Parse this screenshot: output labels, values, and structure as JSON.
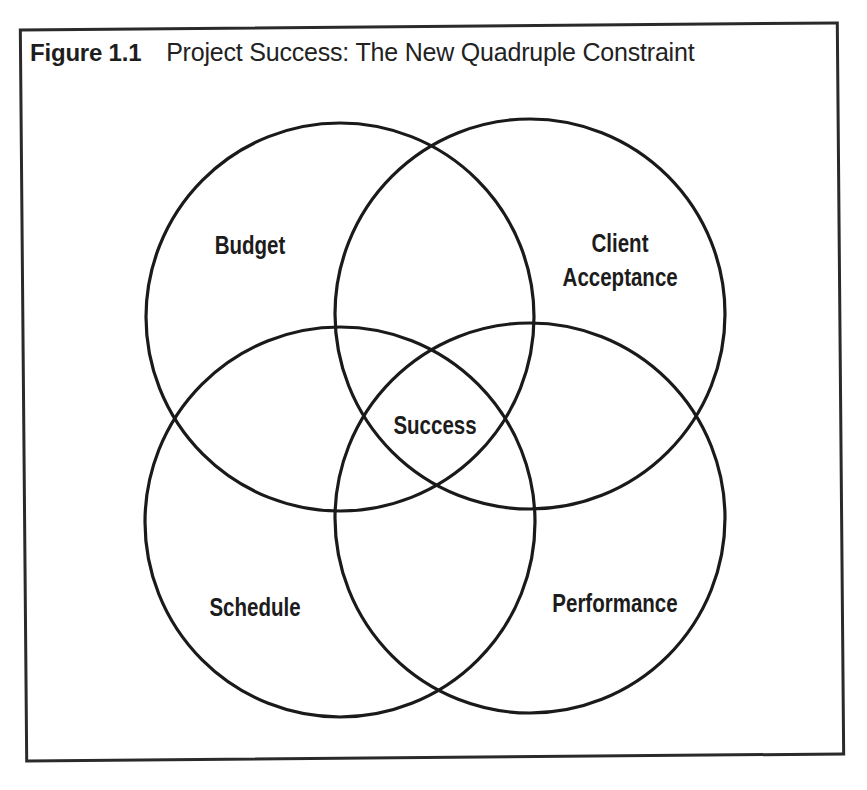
{
  "figure": {
    "number": "Figure 1.1",
    "title": "Project Success: The New Quadruple Constraint"
  },
  "venn": {
    "sets": [
      {
        "id": "budget",
        "label": "Budget",
        "cx": 340,
        "cy": 317,
        "r": 194
      },
      {
        "id": "client-acceptance",
        "label_line1": "Client",
        "label_line2": "Acceptance",
        "cx": 530,
        "cy": 314,
        "r": 195
      },
      {
        "id": "schedule",
        "label": "Schedule",
        "cx": 340,
        "cy": 522,
        "r": 195
      },
      {
        "id": "performance",
        "label": "Performance",
        "cx": 530,
        "cy": 518,
        "r": 195
      }
    ],
    "intersection_label": "Success"
  },
  "colors": {
    "stroke": "#1a1a1a",
    "background": "#ffffff",
    "text": "#1e1e1e"
  }
}
